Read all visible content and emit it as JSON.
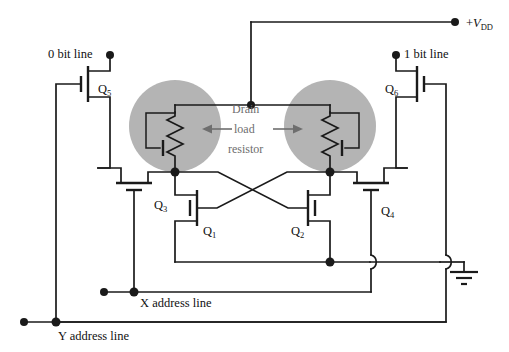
{
  "figure": {
    "background_color": "#ffffff",
    "line_color": "#1a1a1a",
    "shade_color": "#b4b4b4",
    "annotation_color": "#6e6e6e"
  },
  "labels": {
    "vdd_prefix": "+",
    "vdd_symbol": "V",
    "vdd_subscript": "DD",
    "bit_line_0": "0 bit line",
    "bit_line_1": "1 bit line",
    "x_address": "X address line",
    "y_address": "Y address line"
  },
  "annotation": {
    "line1": "Drain",
    "line2": "load",
    "line3": "resistor"
  },
  "transistors": [
    {
      "id": "q1",
      "letter": "Q",
      "subscript": "1",
      "role": "cross-coupled driver left"
    },
    {
      "id": "q2",
      "letter": "Q",
      "subscript": "2",
      "role": "cross-coupled driver right"
    },
    {
      "id": "q3",
      "letter": "Q",
      "subscript": "3",
      "role": "x-address pass transistor left"
    },
    {
      "id": "q4",
      "letter": "Q",
      "subscript": "4",
      "role": "x-address pass transistor right"
    },
    {
      "id": "q5",
      "letter": "Q",
      "subscript": "5",
      "role": "y-address column select left"
    },
    {
      "id": "q6",
      "letter": "Q",
      "subscript": "6",
      "role": "y-address column select right"
    }
  ],
  "load_resistors": [
    {
      "id": "load-left",
      "type": "depletion-load-resistor",
      "shaded": true
    },
    {
      "id": "load-right",
      "type": "depletion-load-resistor",
      "shaded": true
    }
  ],
  "ground": {
    "symbol": "earth-ground",
    "bars": 3
  }
}
